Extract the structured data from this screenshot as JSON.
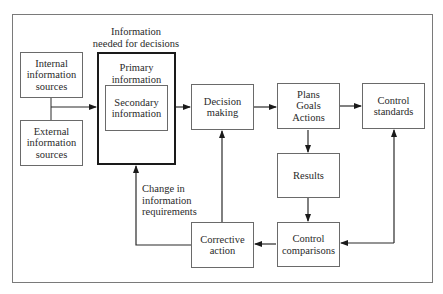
{
  "diagram": {
    "header_label": "Information\nneeded for decisions",
    "nodes": {
      "internal_sources": "Internal\ninformation\nsources",
      "external_sources": "External\ninformation\nsources",
      "primary_information": "Primary\ninformation",
      "secondary_information": "Secondary\ninformation",
      "decision_making": "Decision\nmaking",
      "plans_goals_actions": "Plans\nGoals\nActions",
      "control_standards": "Control\nstandards",
      "results": "Results",
      "control_comparisons": "Control\ncomparisons",
      "corrective_action": "Corrective\naction"
    },
    "edge_labels": {
      "change_in_requirements": "Change in\ninformation\nrequirements"
    },
    "edges": [
      {
        "from": "internal_sources+external_sources",
        "to": "primary_information"
      },
      {
        "from": "primary_information",
        "to": "decision_making"
      },
      {
        "from": "decision_making",
        "to": "plans_goals_actions"
      },
      {
        "from": "plans_goals_actions",
        "to": "control_standards"
      },
      {
        "from": "plans_goals_actions",
        "to": "results"
      },
      {
        "from": "results",
        "to": "control_comparisons"
      },
      {
        "from": "control_comparisons",
        "to": "control_standards",
        "bidirectional": true
      },
      {
        "from": "control_comparisons",
        "to": "corrective_action"
      },
      {
        "from": "corrective_action",
        "to": "decision_making"
      },
      {
        "from": "corrective_action",
        "to": "primary_information",
        "label": "change_in_requirements"
      }
    ],
    "colors": {
      "line": "#2a2a2a",
      "box_border": "#6a6a6a",
      "frame": "#7a7a7a",
      "text": "#2a2a2a"
    }
  }
}
